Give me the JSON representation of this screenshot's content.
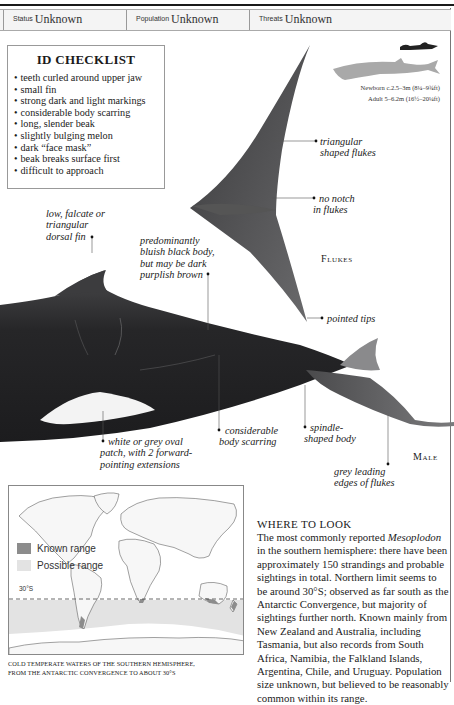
{
  "stats": {
    "status_label": "Status",
    "status_value": "Unknown",
    "population_label": "Population",
    "population_value": "Unknown",
    "threats_label": "Threats",
    "threats_value": "Unknown"
  },
  "checklist": {
    "title": "ID CHECKLIST",
    "items": [
      "teeth curled around upper jaw",
      "small fin",
      "strong dark and light markings",
      "considerable body scarring",
      "long, slender beak",
      "slightly bulging melon",
      "dark “face mask”",
      "beak breaks surface first",
      "difficult to approach"
    ]
  },
  "size": {
    "newborn": "Newborn c.2.5–3m (8¼–9¾ft)",
    "adult": "Adult 5–6.2m (16½–20¼ft)"
  },
  "flukes": {
    "label": "Flukes",
    "callouts": {
      "triangular": [
        "triangular",
        "shaped flukes"
      ],
      "no_notch": [
        "no notch",
        "in flukes"
      ],
      "pointed": [
        "pointed tips"
      ]
    }
  },
  "male": {
    "label": "Male",
    "callouts": {
      "dorsal": [
        "low, falcate or",
        "triangular",
        "dorsal fin"
      ],
      "body_color": [
        "predominantly",
        "bluish black body,",
        "but may be dark",
        "purplish brown"
      ],
      "patch": [
        "white or grey oval",
        "patch, with 2 forward-",
        "pointing extensions"
      ],
      "scarring": [
        "considerable",
        "body scarring"
      ],
      "spindle": [
        "spindle-",
        "shaped body"
      ],
      "edges": [
        "grey leading",
        "edges of flukes"
      ]
    }
  },
  "map": {
    "legend": [
      {
        "label": "Known range",
        "color": "#8c8c8c"
      },
      {
        "label": "Possible range",
        "color": "#e3e3e3"
      }
    ],
    "latitude_label": "30°S",
    "caption_line1": "COLD TEMPERATE WATERS OF THE SOUTHERN HEMISPHERE,",
    "caption_line2": "FROM THE ANTARCTIC CONVERGENCE TO ABOUT 30°S"
  },
  "where_to_look": {
    "title": "Where to Look",
    "body_pre": "The most commonly reported ",
    "body_em": "Mesoplodon",
    "body_post": " in the southern hemisphere: there have been approximately 150 strandings and probable sightings in total. Northern limit seems to be around 30°S; observed as far south as the Antarctic Convergence, but majority of sightings further north. Known mainly from New Zealand and Australia, including Tasmania, but also records from South Africa, Namibia, the Falkland Islands, Argentina, Chile, and Uruguay. Population size unknown, but believed to be reasonably common within its range."
  }
}
